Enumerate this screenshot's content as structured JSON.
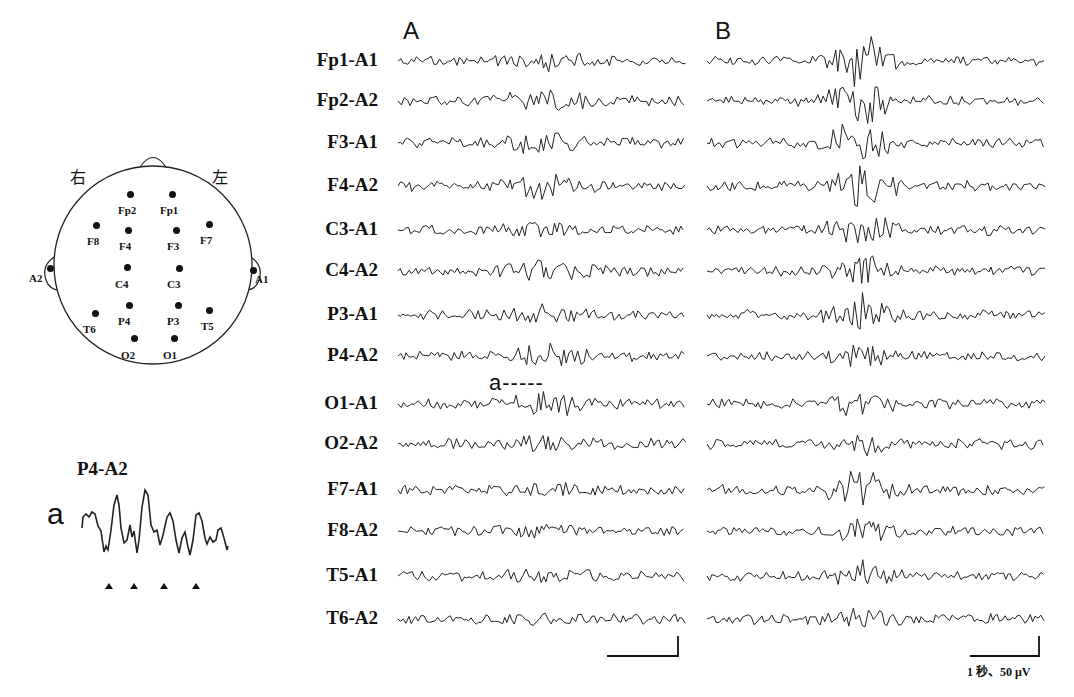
{
  "panels": {
    "A": {
      "label": "A",
      "x0": 398,
      "x1": 683
    },
    "B": {
      "label": "B",
      "x0": 707,
      "x1": 1043
    }
  },
  "channels": [
    {
      "label": "Fp1-A1",
      "y": 61
    },
    {
      "label": "Fp2-A2",
      "y": 101
    },
    {
      "label": "F3-A1",
      "y": 143
    },
    {
      "label": "F4-A2",
      "y": 186
    },
    {
      "label": "C3-A1",
      "y": 230
    },
    {
      "label": "C4-A2",
      "y": 271
    },
    {
      "label": "P3-A1",
      "y": 315
    },
    {
      "label": "P4-A2",
      "y": 356
    },
    {
      "label": "O1-A1",
      "y": 404
    },
    {
      "label": "O2-A2",
      "y": 444
    },
    {
      "label": "F7-A1",
      "y": 490
    },
    {
      "label": "F8-A2",
      "y": 531
    },
    {
      "label": "T5-A1",
      "y": 576
    },
    {
      "label": "T6-A2",
      "y": 619
    }
  ],
  "annotation_a": {
    "label": "a-----"
  },
  "head_map": {
    "right_label": "右",
    "left_label": "左",
    "electrodes": [
      {
        "label": "Fp2",
        "dx": 130,
        "dy": 194,
        "lx": 118,
        "ly": 204
      },
      {
        "label": "Fp1",
        "dx": 172,
        "dy": 194,
        "lx": 160,
        "ly": 204
      },
      {
        "label": "F8",
        "dx": 96,
        "dy": 225,
        "lx": 87,
        "ly": 235
      },
      {
        "label": "F4",
        "dx": 128,
        "dy": 230,
        "lx": 119,
        "ly": 240
      },
      {
        "label": "F3",
        "dx": 176,
        "dy": 230,
        "lx": 167,
        "ly": 240
      },
      {
        "label": "F7",
        "dx": 209,
        "dy": 224,
        "lx": 200,
        "ly": 234
      },
      {
        "label": "A2",
        "dx": 50,
        "dy": 268,
        "lx": 29,
        "ly": 272
      },
      {
        "label": "C4",
        "dx": 127,
        "dy": 267,
        "lx": 115,
        "ly": 278
      },
      {
        "label": "C3",
        "dx": 179,
        "dy": 268,
        "lx": 167,
        "ly": 278
      },
      {
        "label": "A1",
        "dx": 253,
        "dy": 270,
        "lx": 255,
        "ly": 273
      },
      {
        "label": "T6",
        "dx": 95,
        "dy": 313,
        "lx": 83,
        "ly": 323
      },
      {
        "label": "P4",
        "dx": 129,
        "dy": 305,
        "lx": 118,
        "ly": 315
      },
      {
        "label": "P3",
        "dx": 178,
        "dy": 305,
        "lx": 167,
        "ly": 315
      },
      {
        "label": "T5",
        "dx": 209,
        "dy": 310,
        "lx": 201,
        "ly": 320
      },
      {
        "label": "O2",
        "dx": 134,
        "dy": 338,
        "lx": 121,
        "ly": 349
      },
      {
        "label": "O1",
        "dx": 174,
        "dy": 338,
        "lx": 163,
        "ly": 349
      }
    ]
  },
  "inset": {
    "channel_label": "P4-A2",
    "marker_label": "a",
    "triangles": 4
  },
  "scale_bar": {
    "label": "1 秒、50 μV",
    "time": "1 秒",
    "amplitude": "50 μV"
  },
  "colors": {
    "ink": "#111111",
    "background": "#ffffff"
  }
}
